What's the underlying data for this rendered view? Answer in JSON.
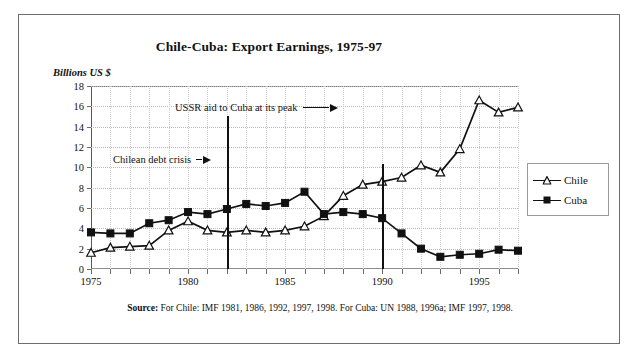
{
  "figure": {
    "title": "Chile-Cuba:  Export Earnings, 1975-97",
    "y_axis_label": "Billions US $",
    "source_bold": "Source:",
    "source_text": " For Chile: IMF 1981, 1986, 1992, 1997, 1998. For Cuba: UN 1988, 1996a; IMF 1997, 1998."
  },
  "legend": {
    "position": "right",
    "entries": [
      {
        "label": "Chile",
        "marker": "open-triangle",
        "color": "#111111"
      },
      {
        "label": "Cuba",
        "marker": "filled-square",
        "color": "#111111"
      }
    ]
  },
  "annotations": [
    {
      "label": "USSR aid to Cuba at its peak",
      "year": 1982,
      "value_top": 18,
      "value_bottom": 0,
      "arrow": "right"
    },
    {
      "label": "Chilean debt crisis",
      "year": 1990,
      "value_top": 18,
      "value_bottom": 0,
      "arrow": "right"
    }
  ],
  "chart_data": {
    "type": "line",
    "title": "Chile-Cuba:  Export Earnings, 1975-97",
    "xlabel": "",
    "ylabel": "Billions US $",
    "ylim": [
      0,
      18
    ],
    "xlim": [
      1975,
      1997
    ],
    "ytick_labels": [
      "0",
      "2",
      "4",
      "6",
      "8",
      "10",
      "12",
      "14",
      "16",
      "18"
    ],
    "yticks": [
      0,
      2,
      4,
      6,
      8,
      10,
      12,
      14,
      16,
      18
    ],
    "xtick_labels": [
      "1975",
      "1980",
      "1985",
      "1990",
      "1995"
    ],
    "xticks": [
      1975,
      1980,
      1985,
      1990,
      1995
    ],
    "grid": true,
    "legend": [
      "Chile",
      "Cuba"
    ],
    "x": [
      1975,
      1976,
      1977,
      1978,
      1979,
      1980,
      1981,
      1982,
      1983,
      1984,
      1985,
      1986,
      1987,
      1988,
      1989,
      1990,
      1991,
      1992,
      1993,
      1994,
      1995,
      1996,
      1997
    ],
    "series": [
      {
        "name": "Chile",
        "marker": "open-triangle",
        "values": [
          1.6,
          2.1,
          2.2,
          2.3,
          3.8,
          4.7,
          3.8,
          3.6,
          3.8,
          3.6,
          3.8,
          4.2,
          5.2,
          7.2,
          8.3,
          8.6,
          9.0,
          10.2,
          9.5,
          11.8,
          16.6,
          15.4,
          15.9
        ]
      },
      {
        "name": "Cuba",
        "marker": "filled-square",
        "values": [
          3.6,
          3.5,
          3.5,
          4.5,
          4.8,
          5.6,
          5.4,
          5.9,
          6.4,
          6.2,
          6.5,
          7.6,
          5.4,
          5.6,
          5.4,
          5.0,
          3.5,
          2.0,
          1.2,
          1.4,
          1.5,
          1.9,
          1.8
        ]
      }
    ],
    "annotations": [
      {
        "text": "USSR aid to Cuba at its peak",
        "at_year": 1982
      },
      {
        "text": "Chilean debt crisis",
        "at_year": 1990
      }
    ]
  }
}
